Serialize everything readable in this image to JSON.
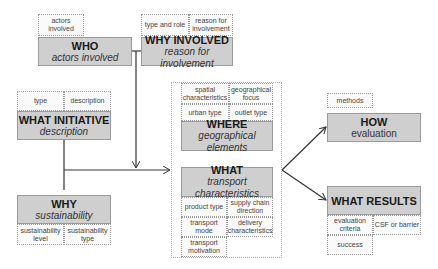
{
  "who": {
    "title": "WHO",
    "subtitle": "actors involved",
    "tags": [
      "actors involved"
    ]
  },
  "why_involved": {
    "title": "WHY INVOLVED",
    "subtitle": "reason for involvement",
    "tags": [
      "type and role",
      "reason for involvement"
    ]
  },
  "what_initiative": {
    "title": "WHAT INITIATIVE",
    "subtitle": "description",
    "tags": [
      "type",
      "description"
    ]
  },
  "why": {
    "title": "WHY",
    "subtitle": "sustainability",
    "tags": [
      "sustainability level",
      "sustainability type"
    ]
  },
  "where": {
    "title": "WHERE",
    "subtitle": "geographical elements",
    "tags": [
      "spatial characteristics",
      "geographical focus",
      "urban type",
      "outlet type"
    ]
  },
  "what": {
    "title": "WHAT",
    "subtitle": "transport characteristics",
    "tags": [
      "product type",
      "supply chain direction",
      "transport mode",
      "delivery characteristics",
      "transport motivation"
    ]
  },
  "how": {
    "title": "HOW",
    "subtitle": "evaluation",
    "tags": [
      "methods"
    ]
  },
  "what_results": {
    "title": "WHAT RESULTS",
    "tags": [
      "evaluation criteria",
      "CSF or barrier",
      "success"
    ]
  },
  "colors": {
    "box_fill": "#cfcfcf",
    "box_border": "#9a9a9a",
    "line": "#333333"
  }
}
